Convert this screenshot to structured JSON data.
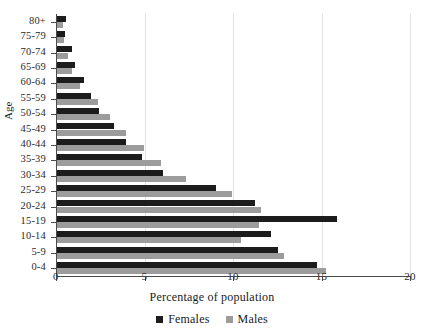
{
  "chart_data": {
    "type": "bar",
    "orientation": "horizontal",
    "title": "",
    "xlabel": "Percentage of population",
    "ylabel": "Age",
    "xlim": [
      0,
      20
    ],
    "ylim": null,
    "grid": true,
    "grid_axis": "x",
    "legend_position": "bottom-center",
    "xticks": [
      0,
      5,
      10,
      15,
      20
    ],
    "xtick_labels": [
      "0",
      "5",
      "10",
      "15",
      "20"
    ],
    "categories": [
      "80+",
      "75-79",
      "70-74",
      "65-69",
      "60-64",
      "55-59",
      "50-54",
      "45-49",
      "40-44",
      "35-39",
      "30-34",
      "25-29",
      "20-24",
      "15-19",
      "10-14",
      "5-9",
      "0-4"
    ],
    "series": [
      {
        "name": "Females",
        "color": "#1c1c1c",
        "values": [
          0.5,
          0.45,
          0.85,
          1.0,
          1.5,
          1.9,
          2.4,
          3.2,
          3.9,
          4.8,
          6.0,
          9.0,
          11.2,
          15.8,
          12.1,
          12.5,
          14.7
        ]
      },
      {
        "name": "Males",
        "color": "#9c9c9c",
        "values": [
          0.35,
          0.4,
          0.6,
          0.85,
          1.3,
          2.3,
          3.0,
          3.9,
          4.9,
          5.9,
          7.3,
          9.9,
          11.5,
          11.4,
          10.4,
          12.8,
          15.2
        ]
      }
    ]
  },
  "legend": {
    "entries": [
      {
        "label": "Females",
        "color": "#1c1c1c"
      },
      {
        "label": "Males",
        "color": "#9c9c9c"
      }
    ]
  },
  "axes": {
    "x_title": "Percentage of population",
    "y_title": "Age"
  },
  "colors": {
    "females": "#1c1c1c",
    "males": "#9c9c9c",
    "axis": "#4a4a4a",
    "grid": "#e2e2e2",
    "background": "#ffffff"
  }
}
